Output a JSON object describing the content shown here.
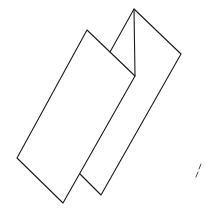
{
  "figure": {
    "stroke_color": "#1a1a1a",
    "background_color": "#ffffff",
    "panels": [
      {
        "name": "front-panel",
        "points": [
          [
            87,
            30
          ],
          [
            135,
            76
          ],
          [
            63,
            203
          ],
          [
            17,
            158
          ]
        ]
      },
      {
        "name": "back-panel",
        "points": [
          [
            134,
            9
          ],
          [
            181,
            54
          ],
          [
            101,
            195
          ],
          [
            80,
            174
          ]
        ]
      }
    ],
    "fold_lines": [
      {
        "name": "center-crease",
        "from": [
          134,
          9
        ],
        "to": [
          135,
          76
        ]
      },
      {
        "name": "back-panel-left-edge",
        "from": [
          134,
          9
        ],
        "to": [
          110,
          52
        ]
      }
    ],
    "marks": [
      {
        "name": "edge-dash-marks",
        "from": [
          200,
          165
        ],
        "to": [
          197,
          178
        ]
      }
    ]
  }
}
